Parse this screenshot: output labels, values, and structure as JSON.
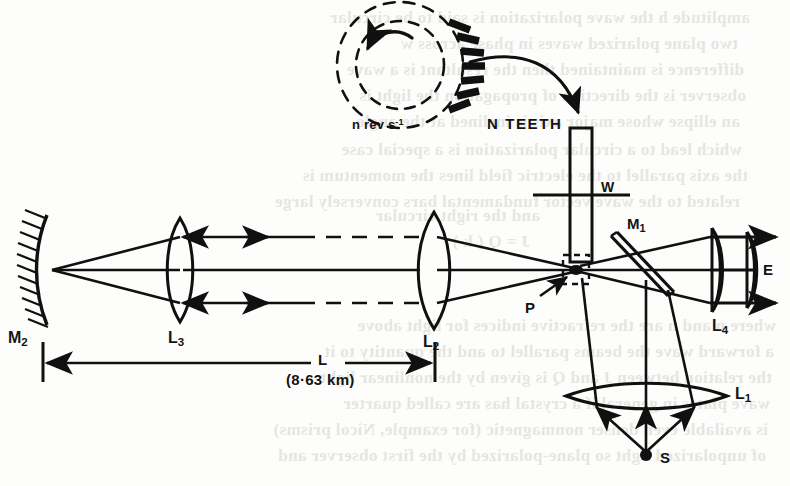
{
  "figure": {
    "type": "optics-ray-diagram",
    "ink_color": "#101010",
    "paper_color": "#fdfdfb"
  },
  "labels": {
    "wheel_speed": "n rev s",
    "wheel_speed_exponent": "-1",
    "teeth": "N TEETH",
    "wheel": "W",
    "mirror1": "M",
    "mirror1_sub": "1",
    "mirror2": "M",
    "mirror2_sub": "2",
    "lens1": "L",
    "lens1_sub": "1",
    "lens2": "L",
    "lens2_sub": "2",
    "lens3": "L",
    "lens3_sub": "3",
    "lens4": "L",
    "lens4_sub": "4",
    "aperture": "P",
    "source": "S",
    "eye": "E",
    "baseline": "L",
    "baseline_value": "(8·63 km)"
  },
  "bleed_through_lines": [
    {
      "x": 40,
      "y": 8,
      "text": "amplitude  h  the  wave polarization  is  said  to  be  circular"
    },
    {
      "x": 52,
      "y": 34,
      "text": "two  plane  polarized  waves  in  phase  across  w"
    },
    {
      "x": 46,
      "y": 60,
      "text": "difference  is  maintained  then  the  resultant  is  a  wave"
    },
    {
      "x": 44,
      "y": 86,
      "text": "observer  is  the  direction  of  propagation  the  light  is"
    },
    {
      "x": 50,
      "y": 112,
      "text": "an  ellipse  whose  major  axis  is  inclined  at  the  angle"
    },
    {
      "x": 48,
      "y": 140,
      "text": "which  lead  to  a  circular  polarization  is  a  special  case"
    },
    {
      "x": 42,
      "y": 166,
      "text": "the  axis  parallel  to  the  electric  field  lines  the  momentum  is"
    },
    {
      "x": 50,
      "y": 192,
      "text": "related  to  the  wave  vector  fundamental  bars  conversely  large"
    },
    {
      "x": 250,
      "y": 206,
      "text": "and  the  right  circular"
    },
    {
      "x": 260,
      "y": 232,
      "text": "J  =  Q  ( k )"
    },
    {
      "x": 14,
      "y": 316,
      "text": "where  n  and  n  are  the  refractive  indices  for  light  above"
    },
    {
      "x": 16,
      "y": 342,
      "text": "a  forward  wave  the  beams  parallel  to  and  the  quantity  to  it"
    },
    {
      "x": 18,
      "y": 368,
      "text": "the  relation  between  J  and  Q  is  given  by  the  nonlinear  light"
    },
    {
      "x": 20,
      "y": 394,
      "text": "wave  plates  in  general  if  a  crystal  has  are  called  quarter"
    },
    {
      "x": 22,
      "y": 420,
      "text": "is  available  even  denser  nonmagnetic  (for  example,  Nicol  prisms)"
    },
    {
      "x": 24,
      "y": 446,
      "text": "of  unpolarized  light  so  plane-polarized  by  the  first  observer  and"
    }
  ],
  "ray_arrows": {
    "outgoing_style": "dashed-with-solid-arrowhead-right",
    "return_style": "solid-with-solid-arrowhead-left",
    "exit_style": "solid-with-solid-arrowhead-right"
  },
  "components": [
    {
      "name": "source",
      "label": "S",
      "kind": "point-source"
    },
    {
      "name": "lens-1",
      "label": "L1",
      "kind": "biconvex-lens-wide"
    },
    {
      "name": "beam-splitter",
      "label": "M1",
      "kind": "half-silvered-plate-45deg"
    },
    {
      "name": "toothed-wheel",
      "label": "W",
      "kind": "rotating-toothed-wheel-edge-on"
    },
    {
      "name": "aperture",
      "label": "P",
      "kind": "focal-gap-at-wheel-rim"
    },
    {
      "name": "lens-2",
      "label": "L2",
      "kind": "biconvex-collimating-lens"
    },
    {
      "name": "lens-3",
      "label": "L3",
      "kind": "biconvex-focusing-lens"
    },
    {
      "name": "mirror-2",
      "label": "M2",
      "kind": "concave-mirror-hatched"
    },
    {
      "name": "lens-4",
      "label": "L4",
      "kind": "eyepiece-doublet"
    },
    {
      "name": "eye",
      "label": "E",
      "kind": "observer-direction"
    },
    {
      "name": "baseline",
      "label": "L",
      "kind": "dimension-line"
    }
  ]
}
